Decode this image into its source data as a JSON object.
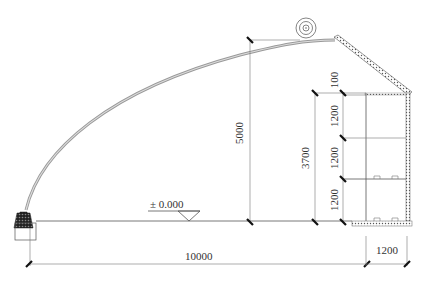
{
  "drawing": {
    "type": "greenhouse cross-section",
    "ground_level_label": "± 0.000",
    "dimensions": {
      "total_span": "10000",
      "ridge_height": "5000",
      "north_wall_height": "3700",
      "north_wall_depth": "1200",
      "wall_top_offset": "100",
      "wall_segment_1": "1200",
      "wall_segment_2": "1200",
      "wall_segment_3": "1200"
    },
    "elements": [
      "arched-film-roof",
      "insulation-roll",
      "back-roof-slope",
      "north-wall-shelving",
      "front-footing",
      "ground-line"
    ]
  }
}
